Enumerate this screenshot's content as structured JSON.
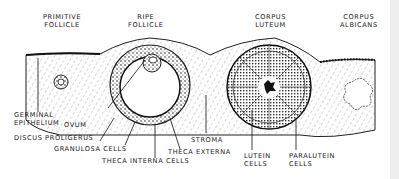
{
  "diagram": {
    "top_labels": [
      {
        "id": "primitive-follicle",
        "line1": "PRIMITIVE",
        "line2": "FOLLICLE"
      },
      {
        "id": "ripe-follicle",
        "line1": "RIPE",
        "line2": "FOLLICLE"
      },
      {
        "id": "corpus-luteum",
        "line1": "CORPUS",
        "line2": "LUTEUM"
      },
      {
        "id": "corpus-albicans",
        "line1": "CORPUS",
        "line2": "ALBICANS"
      }
    ],
    "bottom_labels": {
      "germinal_epithelium": {
        "line1": "GERMINAL",
        "line2": "EPITHELIUM"
      },
      "ovum": "OVUM",
      "discus_proligerus": "DISCUS PROLIGERUS",
      "granulosa_cells": "GRANULOSA CELLS",
      "theca_interna_cells": "THECA INTERNA CELLS",
      "theca_externa": "THECA EXTERNA",
      "stroma": "STROMA",
      "lutein_cells": {
        "line1": "LUTEIN",
        "line2": "CELLS"
      },
      "paralutein_cells": {
        "line1": "PARALUTEIN",
        "line2": "CELLS"
      }
    },
    "colors": {
      "ink": "#1a1a1a",
      "paper": "#ffffff",
      "edge": "#eeeeee"
    }
  }
}
